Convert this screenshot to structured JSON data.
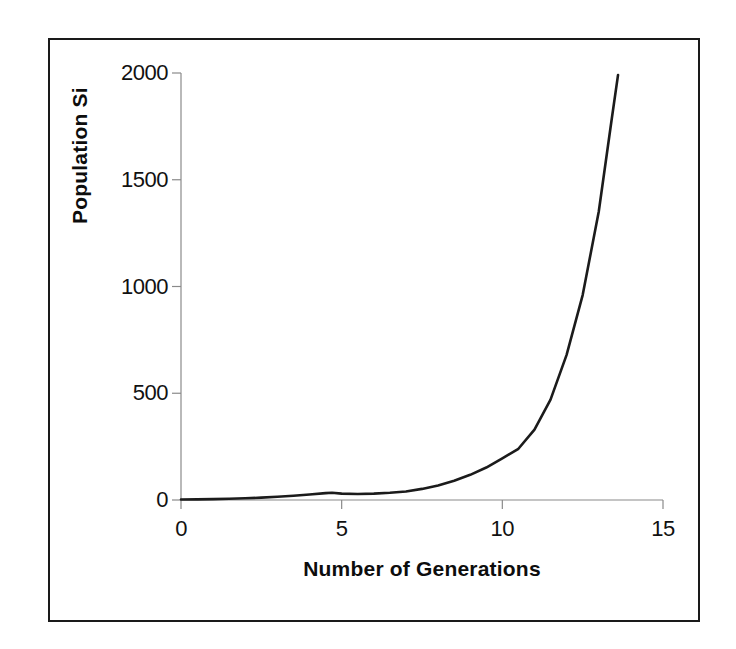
{
  "figure": {
    "background_color": "#ffffff",
    "border_color": "#1a1a1a",
    "line_color": "#1b1b1b",
    "axis_color": "#8a8a8a"
  },
  "chart_data": {
    "type": "line",
    "title": "",
    "xlabel": "Number of Generations",
    "ylabel": "Population Si",
    "xlim": [
      0,
      15
    ],
    "ylim": [
      0,
      2000
    ],
    "xticks": [
      "0",
      "5",
      "10",
      "15"
    ],
    "xtick_values": [
      0,
      5,
      10,
      15
    ],
    "yticks": [
      "0",
      "500",
      "1000",
      "1500",
      "2000"
    ],
    "ytick_values": [
      0,
      500,
      1000,
      1500,
      2000
    ],
    "grid": false,
    "legend": "none",
    "series": [
      {
        "name": "Population Size",
        "x": [
          0,
          0.5,
          1,
          1.5,
          2,
          2.5,
          3,
          3.5,
          4,
          4.5,
          4.7,
          5,
          5.5,
          6,
          6.5,
          7,
          7.5,
          8,
          8.5,
          9,
          9.5,
          10,
          10.5,
          11,
          11.5,
          12,
          12.5,
          13,
          13.4,
          13.6
        ],
        "y": [
          2,
          3,
          4,
          6,
          8,
          11,
          15,
          20,
          26,
          32,
          34,
          30,
          28,
          30,
          34,
          40,
          52,
          68,
          90,
          118,
          152,
          195,
          240,
          330,
          470,
          680,
          960,
          1350,
          1780,
          1990
        ]
      }
    ],
    "annotations": []
  },
  "axis": {
    "x_tick_title": "Number of Generations",
    "y_tick_title": "Population Si"
  }
}
